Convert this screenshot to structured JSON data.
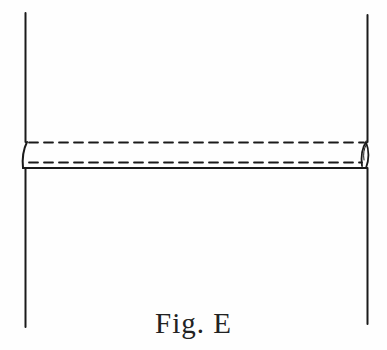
{
  "figure": {
    "caption": "Fig. E",
    "stroke_color": "#1a1a1a",
    "elements": {
      "left_edge": {
        "x": 25,
        "y1": 13,
        "y2": 327
      },
      "right_edge": {
        "x": 367,
        "y1": 15,
        "y2": 324
      },
      "folded_band": {
        "top_dashed_y": 142,
        "bottom_dashed_y": 162,
        "bottom_solid_y": 168,
        "x_start": 25,
        "x_end": 367
      }
    }
  }
}
